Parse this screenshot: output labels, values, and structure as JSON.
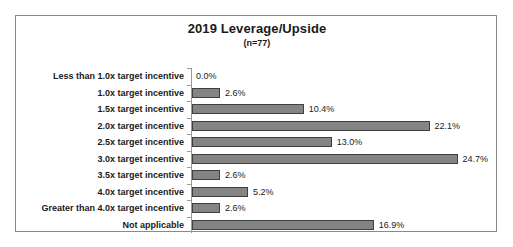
{
  "chart_data": {
    "type": "bar",
    "orientation": "horizontal",
    "title": "2019 Leverage/Upside",
    "subtitle": "(n=77)",
    "sample_size": 77,
    "xlabel": "",
    "ylabel": "",
    "xlim": [
      0,
      25
    ],
    "grid": false,
    "legend": "none",
    "value_suffix": "%",
    "colors": {
      "bar_fill": "#848484",
      "bar_border": "#3f3f3f",
      "frame_border": "#8a8a8a",
      "axis_line": "#9a9a9a",
      "text": "#1a1a1a",
      "background": "#ffffff"
    },
    "categories": [
      "Less than 1.0x target incentive",
      "1.0x target incentive",
      "1.5x target incentive",
      "2.0x target incentive",
      "2.5x target incentive",
      "3.0x target incentive",
      "3.5x target incentive",
      "4.0x target incentive",
      "Greater than 4.0x target incentive",
      "Not applicable"
    ],
    "values": [
      0.0,
      2.6,
      10.4,
      22.1,
      13.0,
      24.7,
      2.6,
      5.2,
      2.6,
      16.9
    ],
    "value_labels": [
      "0.0%",
      "2.6%",
      "10.4%",
      "22.1%",
      "13.0%",
      "24.7%",
      "2.6%",
      "5.2%",
      "2.6%",
      "16.9%"
    ]
  }
}
